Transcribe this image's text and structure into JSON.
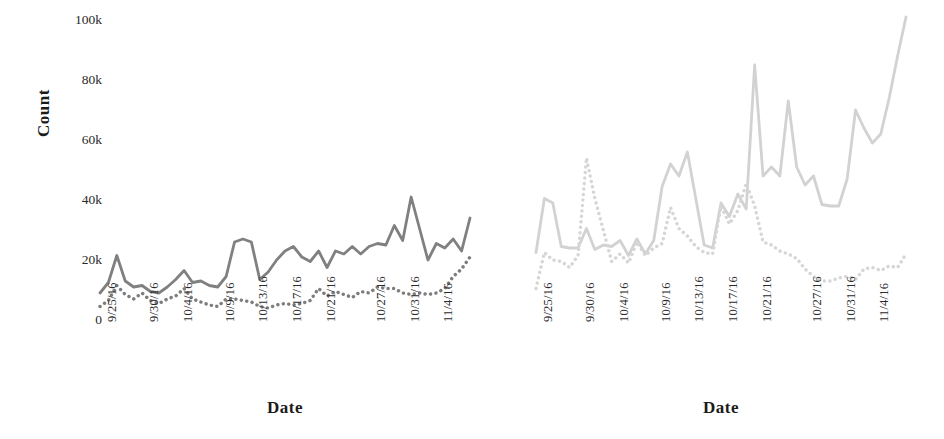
{
  "chart_data": [
    {
      "panel": "left",
      "type": "line",
      "title": "",
      "xlabel": "Date",
      "ylabel": "Count",
      "ylim": [
        0,
        100000
      ],
      "yticks": [
        0,
        20000,
        40000,
        60000,
        80000,
        100000
      ],
      "ytick_labels": [
        "0",
        "20k",
        "40k",
        "60k",
        "80k",
        "100k"
      ],
      "grid": false,
      "legend": "none",
      "xtick_labels": [
        "9/25/16",
        "9/30/16",
        "10/4/16",
        "10/9/16",
        "10/13/16",
        "10/17/16",
        "10/21/16",
        "10/27/16",
        "10/31/16",
        "11/4/16"
      ],
      "xtick_positions": [
        0,
        5,
        9,
        14,
        18,
        22,
        26,
        32,
        36,
        40
      ],
      "x": [
        0,
        1,
        2,
        3,
        4,
        5,
        6,
        7,
        8,
        9,
        10,
        11,
        12,
        13,
        14,
        15,
        16,
        17,
        18,
        19,
        20,
        21,
        22,
        23,
        24,
        25,
        26,
        27,
        28,
        29,
        30,
        31,
        32,
        33,
        34,
        35,
        36,
        37,
        38,
        39,
        40,
        41,
        42,
        43,
        44
      ],
      "series": [
        {
          "name": "solid-series-left",
          "style": "solid",
          "color": "#808080",
          "values": [
            9000,
            12500,
            21500,
            13000,
            11000,
            11500,
            9500,
            9000,
            11000,
            13500,
            16500,
            12500,
            13000,
            11500,
            11000,
            14500,
            26000,
            27000,
            26000,
            13500,
            16000,
            20000,
            23000,
            24500,
            21000,
            19500,
            23000,
            17500,
            23000,
            22000,
            24500,
            22000,
            24500,
            25500,
            25000,
            31500,
            26500,
            41000,
            30500,
            20000,
            25500,
            24000,
            27000,
            23000,
            34000
          ]
        },
        {
          "name": "dotted-series-left",
          "style": "dotted",
          "color": "#7d7d7d",
          "values": [
            4500,
            6500,
            11500,
            8500,
            7000,
            9000,
            6500,
            5500,
            7000,
            8000,
            10500,
            7000,
            6000,
            5000,
            4500,
            7000,
            7000,
            6500,
            6000,
            4500,
            4000,
            5000,
            5500,
            5000,
            5500,
            6500,
            10500,
            8000,
            9500,
            8500,
            7500,
            9500,
            9000,
            11000,
            10500,
            10500,
            9000,
            8500,
            9000,
            8500,
            9000,
            10500,
            14500,
            17000,
            21000
          ]
        }
      ]
    },
    {
      "panel": "right",
      "type": "line",
      "title": "",
      "xlabel": "Date",
      "ylabel": "",
      "ylim": [
        0,
        100000
      ],
      "yticks": [
        0,
        20000,
        40000,
        60000,
        80000,
        100000
      ],
      "grid": false,
      "legend": "none",
      "xtick_labels": [
        "9/25/16",
        "9/30/16",
        "10/4/16",
        "10/9/16",
        "10/13/16",
        "10/17/16",
        "10/21/16",
        "10/27/16",
        "10/31/16",
        "11/4/16"
      ],
      "xtick_positions": [
        0,
        5,
        9,
        14,
        18,
        22,
        26,
        32,
        36,
        40
      ],
      "x": [
        0,
        1,
        2,
        3,
        4,
        5,
        6,
        7,
        8,
        9,
        10,
        11,
        12,
        13,
        14,
        15,
        16,
        17,
        18,
        19,
        20,
        21,
        22,
        23,
        24,
        25,
        26,
        27,
        28,
        29,
        30,
        31,
        32,
        33,
        34,
        35,
        36,
        37,
        38,
        39,
        40,
        41,
        42,
        43,
        44
      ],
      "series": [
        {
          "name": "solid-series-right",
          "style": "solid",
          "color": "#d2d2d2",
          "values": [
            22500,
            40500,
            39000,
            24500,
            24000,
            24000,
            30500,
            23500,
            25000,
            24500,
            26500,
            21500,
            27000,
            22000,
            26500,
            44500,
            52000,
            48000,
            56000,
            40500,
            25000,
            24000,
            39000,
            34500,
            42000,
            37000,
            85000,
            48000,
            51000,
            48000,
            73000,
            51000,
            45000,
            48000,
            38500,
            38000,
            38000,
            47000,
            70000,
            64000,
            59000,
            62000,
            74000,
            88000,
            101000
          ]
        },
        {
          "name": "dotted-series-right",
          "style": "dotted",
          "color": "#d6d6d6",
          "values": [
            10500,
            22500,
            20000,
            19500,
            17500,
            21500,
            54000,
            40500,
            30000,
            19500,
            22000,
            19000,
            26000,
            21500,
            24000,
            25500,
            37500,
            30500,
            28000,
            24500,
            22500,
            22000,
            38000,
            32000,
            36500,
            45500,
            38000,
            26000,
            25000,
            23000,
            22000,
            20500,
            17000,
            14500,
            13000,
            13000,
            14000,
            14500,
            13500,
            17000,
            17500,
            16500,
            18000,
            17500,
            22000
          ]
        }
      ]
    }
  ]
}
